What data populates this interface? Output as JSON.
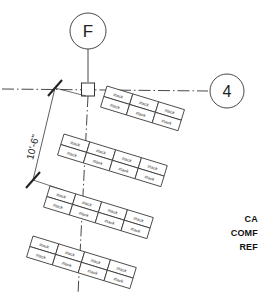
{
  "drawing": {
    "type": "architectural-plan-detail",
    "background_color": "#ffffff",
    "line_color": "#1a1a1a",
    "grid_bubbles": [
      {
        "label": "F",
        "position": "top",
        "cx": 88,
        "cy": 31,
        "r": 18
      },
      {
        "label": "4",
        "position": "right",
        "cx": 227,
        "cy": 91,
        "r": 17
      }
    ],
    "dimension": {
      "text": "10'-6\"",
      "tick_style": "architectural-slash"
    },
    "column_symbol": {
      "name": "column-square",
      "size": 13
    },
    "notes": [
      "CA",
      "COMF",
      "REF"
    ],
    "panel_banks": [
      {
        "name": "panel-bank-1",
        "x": 107,
        "y": 86,
        "rows": 2,
        "cols": 3,
        "cell_w": 27,
        "cell_h": 11,
        "rotation": 17,
        "cell_text": "#tack"
      },
      {
        "name": "panel-bank-2",
        "x": 64,
        "y": 134,
        "rows": 2,
        "cols": 4,
        "cell_w": 27,
        "cell_h": 11,
        "rotation": 17,
        "cell_text": "#tack"
      },
      {
        "name": "panel-bank-3",
        "x": 50,
        "y": 186,
        "rows": 2,
        "cols": 4,
        "cell_w": 27,
        "cell_h": 11,
        "rotation": 17,
        "cell_text": "#tack"
      },
      {
        "name": "panel-bank-4",
        "x": 33,
        "y": 236,
        "rows": 2,
        "cols": 4,
        "cell_w": 27,
        "cell_h": 11,
        "rotation": 17,
        "cell_text": "#tack"
      }
    ]
  }
}
